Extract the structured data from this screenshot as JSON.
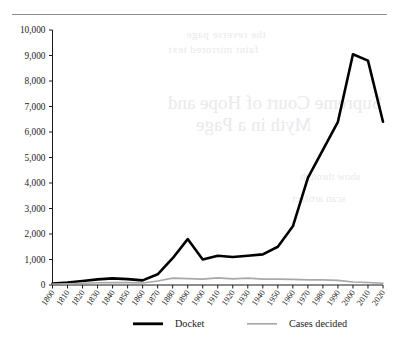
{
  "page": {
    "bleed_through": [
      "the reverse page",
      "faint mirrored text",
      "Supreme Court of Hope and",
      "Myth in a Page",
      "show through",
      "scan artifact"
    ]
  },
  "chart_data": {
    "type": "line",
    "title": "",
    "xlabel": "",
    "ylabel": "",
    "x": [
      1800,
      1810,
      1820,
      1830,
      1840,
      1850,
      1860,
      1870,
      1880,
      1890,
      1900,
      1910,
      1920,
      1930,
      1940,
      1950,
      1960,
      1970,
      1980,
      1990,
      2000,
      2010,
      2020
    ],
    "categories": [
      "1800",
      "1810",
      "1820",
      "1830",
      "1840",
      "1850",
      "1860",
      "1870",
      "1880",
      "1890",
      "1900",
      "1910",
      "1920",
      "1930",
      "1940",
      "1950",
      "1960",
      "1970",
      "1980",
      "1990",
      "2000",
      "2010",
      "2020"
    ],
    "xlim": [
      1800,
      2020
    ],
    "ylim": [
      0,
      10000
    ],
    "yticks": [
      0,
      1000,
      2000,
      3000,
      4000,
      5000,
      6000,
      7000,
      8000,
      9000,
      10000
    ],
    "ytick_labels": [
      "0",
      "1,000",
      "2,000",
      "3,000",
      "4,000",
      "5,000",
      "6,000",
      "7,000",
      "8,000",
      "9,000",
      "10,000"
    ],
    "grid": false,
    "legend_position": "bottom",
    "series": [
      {
        "name": "Docket",
        "color": "#000000",
        "width": 2.6,
        "values": [
          60,
          100,
          160,
          220,
          260,
          230,
          180,
          420,
          1050,
          1800,
          1000,
          1150,
          1100,
          1150,
          1200,
          1500,
          2300,
          4200,
          5300,
          6400,
          9050,
          8800,
          6400
        ]
      },
      {
        "name": "Cases decided",
        "color": "#a8a8a8",
        "width": 1.6,
        "values": [
          40,
          50,
          70,
          90,
          100,
          95,
          80,
          160,
          270,
          250,
          230,
          280,
          240,
          270,
          230,
          230,
          220,
          200,
          200,
          180,
          120,
          100,
          70
        ]
      }
    ]
  },
  "legend": [
    {
      "label": "Docket",
      "color": "#000000"
    },
    {
      "label": "Cases decided",
      "color": "#a8a8a8"
    }
  ]
}
